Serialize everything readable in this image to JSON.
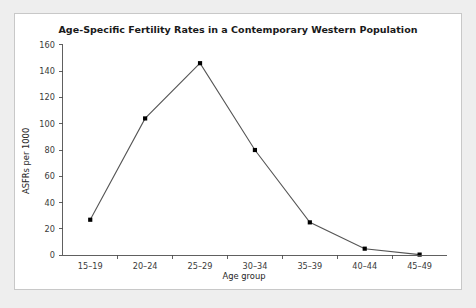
{
  "figure": {
    "background_color": "#ffffff",
    "page_background_color": "#eeeeee",
    "border_color": "#c8c8c8"
  },
  "chart_data": {
    "type": "line",
    "title": "Age-Specific Fertility Rates in a Contemporary Western Population",
    "xlabel": "Age group",
    "ylabel": "ASFRs per 1000",
    "categories": [
      "15–19",
      "20–24",
      "25–29",
      "30–34",
      "35–39",
      "40–44",
      "45–49"
    ],
    "values": [
      27,
      104,
      146,
      80,
      25,
      5,
      0.5
    ],
    "ylim": [
      0,
      160
    ],
    "yticks": [
      0,
      20,
      40,
      60,
      80,
      100,
      120,
      140,
      160
    ],
    "ytick_labels": [
      "0",
      "20",
      "40",
      "60",
      "80",
      "100",
      "120",
      "140",
      "160"
    ],
    "grid": false,
    "legend": false,
    "line_color": "#555555",
    "marker_color": "#000000",
    "marker_shape": "square"
  }
}
